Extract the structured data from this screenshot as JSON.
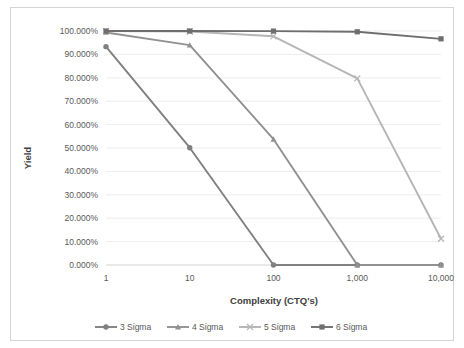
{
  "chart_data": {
    "type": "line",
    "title": "",
    "xlabel": "Complexity (CTQ's)",
    "ylabel": "Yield",
    "x": [
      1,
      10,
      100,
      1000,
      10000
    ],
    "x_tick_labels": [
      "1",
      "10",
      "100",
      "1,000",
      "10,000"
    ],
    "x_scale": "log-categorical",
    "ylim": [
      0,
      1
    ],
    "y_tick_labels": [
      "0.000%",
      "10.000%",
      "20.000%",
      "30.000%",
      "40.000%",
      "50.000%",
      "60.000%",
      "70.000%",
      "80.000%",
      "90.000%",
      "100.000%"
    ],
    "y_tick_values": [
      0,
      0.1,
      0.2,
      0.3,
      0.4,
      0.5,
      0.6,
      0.7,
      0.8,
      0.9,
      1.0
    ],
    "grid": true,
    "legend_position": "bottom",
    "series": [
      {
        "name": "3 Sigma",
        "color": "#808080",
        "marker": "circle",
        "values": [
          0.9332,
          0.5013,
          0.0,
          0.0,
          0.0
        ],
        "value_labels": [
          "93.320%",
          "50.130%",
          "0.000%",
          "0.000%",
          "0.000%"
        ]
      },
      {
        "name": "4 Sigma",
        "color": "#919191",
        "marker": "triangle",
        "values": [
          0.9938,
          0.9396,
          0.5375,
          0.0,
          0.0
        ],
        "value_labels": [
          "99.380%",
          "93.960%",
          "53.750%",
          "0.000%",
          "0.000%"
        ]
      },
      {
        "name": "5 Sigma",
        "color": "#b5b5b5",
        "marker": "cross",
        "values": [
          0.99977,
          0.9977,
          0.9773,
          0.7977,
          0.1122
        ],
        "value_labels": [
          "99.977%",
          "99.770%",
          "97.730%",
          "79.770%",
          "11.220%"
        ]
      },
      {
        "name": "6 Sigma",
        "color": "#6e6e6e",
        "marker": "square",
        "values": [
          0.9999966,
          0.999966,
          0.99966,
          0.9966,
          0.9665
        ],
        "value_labels": [
          "99.9997%",
          "99.997%",
          "99.966%",
          "99.660%",
          "96.650%"
        ]
      }
    ]
  },
  "axis": {
    "y_title": "Yield",
    "x_title": "Complexity (CTQ's)"
  },
  "legend": {
    "items": [
      {
        "label": "3 Sigma"
      },
      {
        "label": "4 Sigma"
      },
      {
        "label": "5 Sigma"
      },
      {
        "label": "6 Sigma"
      }
    ]
  }
}
